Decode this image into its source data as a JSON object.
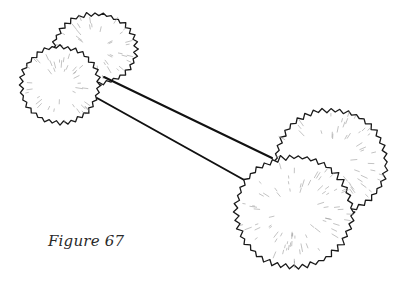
{
  "figure": {
    "caption": "Figure 67",
    "colors": {
      "background": "#ffffff",
      "outline": "#1a1a1a",
      "hatching": "#9a9a9a",
      "rod": "#111111",
      "caption": "#2a2a2a"
    }
  }
}
